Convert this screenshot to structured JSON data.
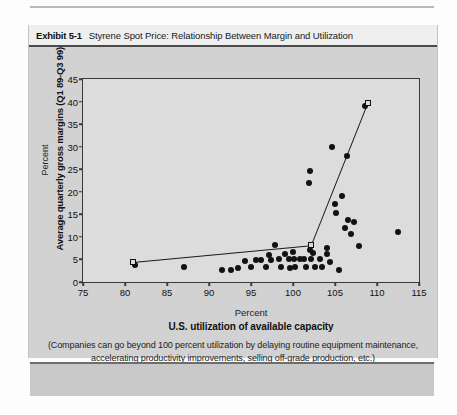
{
  "exhibit": {
    "number": "Exhibit 5-1",
    "title": "Styrene Spot Price: Relationship Between Margin and Utilization"
  },
  "footnote": "(Companies can go beyond 100 percent utilization by delaying routine equipment maintenance, accelerating productivity improvements, selling off-grade production, etc.)",
  "chart_data": {
    "type": "scatter",
    "title": "Styrene Spot Price: Relationship Between Margin and Utilization",
    "xlabel": "U.S. utilization of available capacity",
    "xunit": "Percent",
    "ylabel": "Average quarterly gross margins (Q1 89-Q3 99)",
    "yunit": "Percent",
    "xlim": [
      75,
      115
    ],
    "ylim": [
      0,
      45
    ],
    "xticks": [
      75,
      80,
      85,
      90,
      95,
      100,
      105,
      110,
      115
    ],
    "yticks": [
      0,
      5,
      10,
      15,
      20,
      25,
      30,
      35,
      40,
      45
    ],
    "grid": false,
    "legend": null,
    "series": [
      {
        "name": "Quarterly observations",
        "marker": "filled-circle",
        "points": [
          [
            81.2,
            3.8
          ],
          [
            87.0,
            3.4
          ],
          [
            91.5,
            2.6
          ],
          [
            92.6,
            2.7
          ],
          [
            93.4,
            3.0
          ],
          [
            94.3,
            4.6
          ],
          [
            95.0,
            3.4
          ],
          [
            95.6,
            4.8
          ],
          [
            96.2,
            4.9
          ],
          [
            96.8,
            3.4
          ],
          [
            97.2,
            6.0
          ],
          [
            97.4,
            4.9
          ],
          [
            97.9,
            8.3
          ],
          [
            98.3,
            5.0
          ],
          [
            98.6,
            3.3
          ],
          [
            99.1,
            6.2
          ],
          [
            99.5,
            5.0
          ],
          [
            99.6,
            3.2
          ],
          [
            100.0,
            6.6
          ],
          [
            100.1,
            5.2
          ],
          [
            100.2,
            3.4
          ],
          [
            100.8,
            5.0
          ],
          [
            101.3,
            5.0
          ],
          [
            101.5,
            3.3
          ],
          [
            101.9,
            22.0
          ],
          [
            102.0,
            24.5
          ],
          [
            102.0,
            7.2
          ],
          [
            102.2,
            5.0
          ],
          [
            102.4,
            6.4
          ],
          [
            102.6,
            3.4
          ],
          [
            103.2,
            5.1
          ],
          [
            103.4,
            3.3
          ],
          [
            104.0,
            7.6
          ],
          [
            104.1,
            6.3
          ],
          [
            104.4,
            4.4
          ],
          [
            104.6,
            30.0
          ],
          [
            105.0,
            17.4
          ],
          [
            105.1,
            15.2
          ],
          [
            105.5,
            2.6
          ],
          [
            105.8,
            19.0
          ],
          [
            106.2,
            12.0
          ],
          [
            106.4,
            28.0
          ],
          [
            106.6,
            13.8
          ],
          [
            106.9,
            10.6
          ],
          [
            107.3,
            13.2
          ],
          [
            107.8,
            8.0
          ],
          [
            108.6,
            39.0
          ],
          [
            112.5,
            11.0
          ]
        ]
      },
      {
        "name": "Trend breakpoints",
        "marker": "open-square",
        "points": [
          [
            81.0,
            4.5
          ],
          [
            102.2,
            8.2
          ],
          [
            108.9,
            39.6
          ]
        ]
      }
    ],
    "trend_lines": [
      {
        "name": "low-utilization-trend",
        "from": [
          81.0,
          4.5
        ],
        "to": [
          102.2,
          8.2
        ]
      },
      {
        "name": "high-utilization-trend",
        "from": [
          102.2,
          8.2
        ],
        "to": [
          108.9,
          39.6
        ]
      }
    ]
  }
}
